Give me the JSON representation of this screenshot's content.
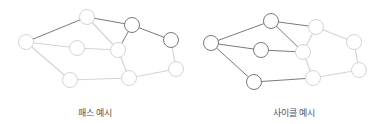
{
  "colors": {
    "dark": "#7a7a7a",
    "light": "#d4d4d4",
    "node_fill": "#ffffff"
  },
  "node_radius": 7.5,
  "diagrams": [
    {
      "name": "path-example",
      "label": "패스 예시",
      "label_x": 95,
      "nodes": {
        "A": [
          26,
          42,
          "light"
        ],
        "B": [
          87,
          17,
          "light"
        ],
        "C": [
          132,
          25,
          "dark"
        ],
        "D": [
          77,
          48,
          "light"
        ],
        "E": [
          118,
          50,
          "light"
        ],
        "F": [
          171,
          40,
          "dark"
        ],
        "G": [
          176,
          69,
          "light"
        ],
        "H": [
          70,
          80,
          "light"
        ],
        "I": [
          129,
          78,
          "light"
        ]
      },
      "edges": [
        [
          "A",
          "B",
          "dark"
        ],
        [
          "B",
          "C",
          "dark"
        ],
        [
          "C",
          "F",
          "dark"
        ],
        [
          "C",
          "E",
          "dark"
        ],
        [
          "A",
          "D",
          "light"
        ],
        [
          "A",
          "H",
          "light"
        ],
        [
          "B",
          "E",
          "light"
        ],
        [
          "D",
          "E",
          "light"
        ],
        [
          "E",
          "I",
          "light"
        ],
        [
          "H",
          "I",
          "light"
        ],
        [
          "I",
          "G",
          "light"
        ],
        [
          "F",
          "G",
          "light"
        ]
      ]
    },
    {
      "name": "cycle-example",
      "label": "사이클 예시",
      "label_x": 294,
      "nodes": {
        "A": [
          211,
          43,
          "dark"
        ],
        "B": [
          271,
          21,
          "dark"
        ],
        "C": [
          316,
          27,
          "light"
        ],
        "D": [
          261,
          50,
          "dark"
        ],
        "E": [
          303,
          52,
          "light"
        ],
        "F": [
          354,
          42,
          "light"
        ],
        "G": [
          359,
          70,
          "light"
        ],
        "H": [
          254,
          82,
          "dark"
        ],
        "I": [
          313,
          78,
          "light"
        ]
      },
      "edges": [
        [
          "A",
          "B",
          "dark"
        ],
        [
          "A",
          "D",
          "dark"
        ],
        [
          "A",
          "H",
          "dark"
        ],
        [
          "B",
          "E",
          "dark"
        ],
        [
          "D",
          "E",
          "dark"
        ],
        [
          "H",
          "I",
          "dark"
        ],
        [
          "B",
          "C",
          "dark"
        ],
        [
          "C",
          "E",
          "light"
        ],
        [
          "C",
          "F",
          "light"
        ],
        [
          "F",
          "G",
          "light"
        ],
        [
          "I",
          "G",
          "light"
        ],
        [
          "E",
          "I",
          "light"
        ]
      ]
    }
  ]
}
